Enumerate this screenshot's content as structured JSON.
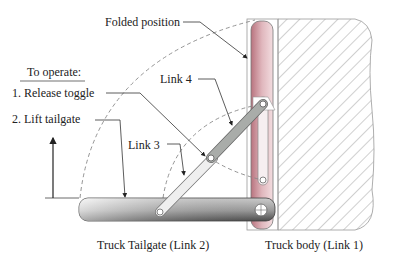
{
  "labels": {
    "folded_position": "Folded position",
    "to_operate": "To operate:",
    "step1": "1.  Release toggle",
    "step2": "2.  Lift tailgate",
    "link4": "Link 4",
    "link3": "Link 3",
    "tailgate": "Truck Tailgate (Link 2)",
    "body": "Truck body (Link 1)"
  },
  "colors": {
    "tailgate_dark": "#555555",
    "tailgate_light": "#e6e6e6",
    "folded_pink": "#c98d96",
    "link_gray": "#a9aca9",
    "hatch": "#8a8a8a"
  }
}
